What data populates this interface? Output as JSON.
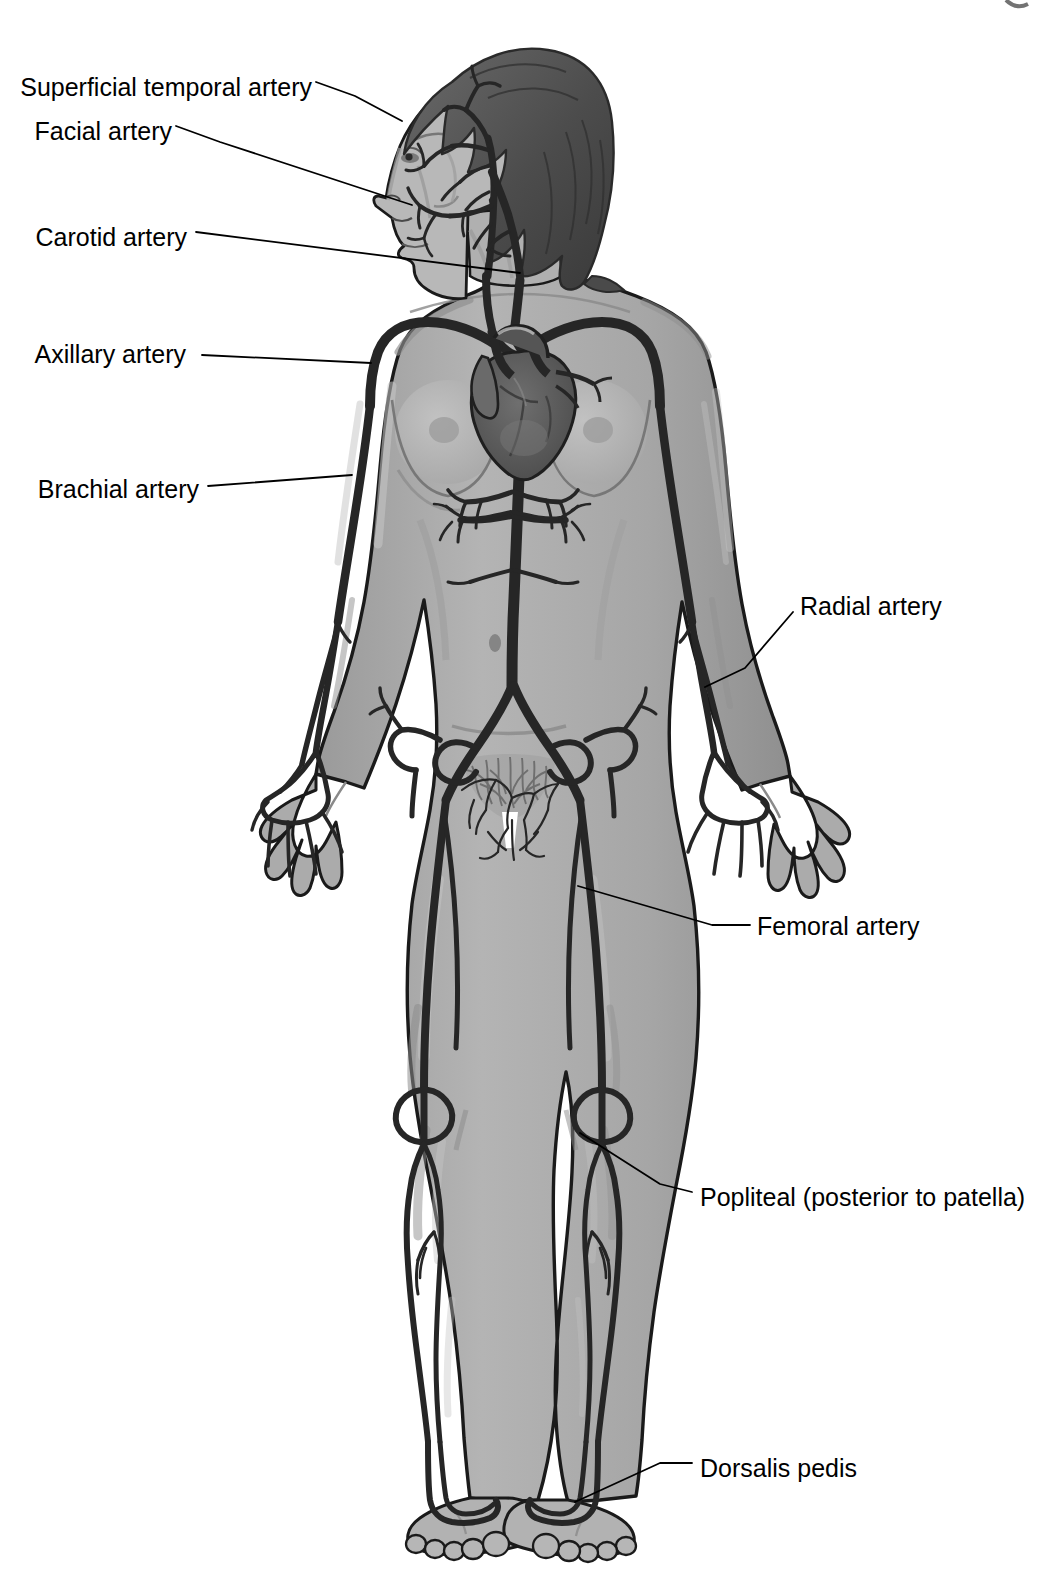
{
  "figure": {
    "view": "anterior full-body female figure with head in left profile",
    "corner_mark": ""
  },
  "colors": {
    "background": "#ffffff",
    "skin_fill": "#a9a9a9",
    "skin_highlight": "#c9c9c9",
    "skin_shadow": "#8d8d8d",
    "outline": "#1a1a1a",
    "artery": "#262626",
    "artery_fill": "#3a3a3a",
    "hair": "#565656",
    "hair_shadow": "#3d3d3d",
    "heart": "#5a5a5a",
    "label_text": "#000000",
    "leader_line": "#000000"
  },
  "labels": [
    {
      "id": "superficial-temporal-artery",
      "text": "Superficial temporal artery",
      "side": "left",
      "text_x": 312,
      "text_y": 86,
      "leader": [
        [
          316,
          82
        ],
        [
          355,
          96
        ],
        [
          402,
          121
        ]
      ]
    },
    {
      "id": "facial-artery",
      "text": "Facial artery",
      "side": "left",
      "text_x": 172,
      "text_y": 130,
      "leader": [
        [
          176,
          126
        ],
        [
          220,
          142
        ],
        [
          412,
          205
        ]
      ]
    },
    {
      "id": "carotid-artery",
      "text": "Carotid artery",
      "side": "left",
      "text_x": 187,
      "text_y": 236,
      "leader": [
        [
          196,
          232
        ],
        [
          520,
          273
        ]
      ]
    },
    {
      "id": "axillary-artery",
      "text": "Axillary artery",
      "side": "left",
      "text_x": 186,
      "text_y": 352,
      "leader": [
        [
          202,
          355
        ],
        [
          371,
          363
        ]
      ]
    },
    {
      "id": "brachial-artery",
      "text": "Brachial artery",
      "side": "left",
      "text_x": 199,
      "text_y": 488,
      "leader": [
        [
          208,
          486
        ],
        [
          352,
          475
        ]
      ]
    },
    {
      "id": "radial-artery",
      "text": "Radial artery",
      "side": "right",
      "text_x": 800,
      "text_y": 605,
      "leader": [
        [
          793,
          612
        ],
        [
          745,
          668
        ],
        [
          705,
          687
        ]
      ]
    },
    {
      "id": "femoral-artery",
      "text": "Femoral artery",
      "side": "right",
      "text_x": 757,
      "text_y": 925,
      "leader": [
        [
          750,
          925
        ],
        [
          712,
          925
        ],
        [
          578,
          886
        ]
      ]
    },
    {
      "id": "popliteal-posterior-to-patella",
      "text": "Popliteal (posterior to patella)",
      "side": "right",
      "text_x": 700,
      "text_y": 1196,
      "leader": [
        [
          692,
          1192
        ],
        [
          660,
          1184
        ],
        [
          580,
          1133
        ]
      ]
    },
    {
      "id": "dorsalis-pedis",
      "text": "Dorsalis pedis",
      "side": "right",
      "text_x": 700,
      "text_y": 1467,
      "leader": [
        [
          692,
          1463
        ],
        [
          660,
          1463
        ],
        [
          575,
          1502
        ]
      ]
    }
  ],
  "arteries_depicted": [
    "superficial temporal artery",
    "facial artery",
    "common carotid artery",
    "subclavian artery",
    "axillary artery",
    "brachial artery",
    "radial artery",
    "ulnar artery",
    "palmar arch",
    "digital arteries",
    "aortic arch",
    "ascending aorta",
    "descending thoracic aorta",
    "abdominal aorta",
    "celiac trunk",
    "renal arteries",
    "common iliac artery",
    "external iliac artery",
    "femoral artery",
    "deep femoral artery",
    "popliteal artery",
    "anterior tibial artery",
    "posterior tibial artery",
    "dorsalis pedis artery"
  ],
  "anatomy_features": [
    "heart",
    "head in left profile with shoulder-length hair",
    "breasts",
    "umbilicus",
    "pubic region",
    "hands with spread fingers",
    "feet with toes"
  ]
}
